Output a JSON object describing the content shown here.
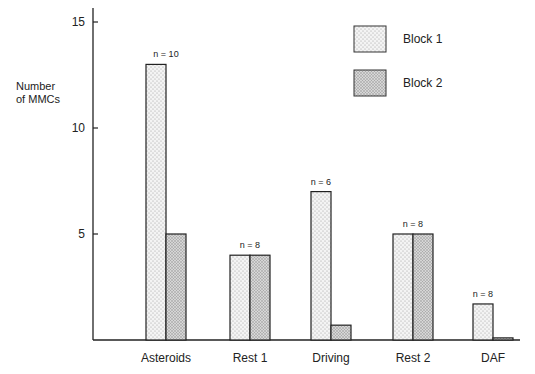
{
  "chart_data": {
    "type": "bar",
    "title": "",
    "xlabel": "",
    "ylabel": "Number of MMCs",
    "ylabel_lines": [
      "Number",
      "of MMCs"
    ],
    "ylim": [
      0,
      16
    ],
    "yticks": [
      5,
      10,
      15
    ],
    "grid": false,
    "legend_position": "top-right",
    "categories": [
      "Asteroids",
      "Rest 1",
      "Driving",
      "Rest 2",
      "DAF"
    ],
    "annotations": [
      "n = 10",
      "n = 8",
      "n = 6",
      "n = 8",
      "n = 8"
    ],
    "series": [
      {
        "name": "Block 1",
        "values": [
          13,
          4,
          7,
          5,
          1.7
        ],
        "fill": "#f2f2f2",
        "pattern": "fine-dots"
      },
      {
        "name": "Block 2",
        "values": [
          5,
          4,
          0.7,
          5,
          0.1
        ],
        "fill": "#cfcfcf",
        "pattern": "dense-dots"
      }
    ]
  }
}
